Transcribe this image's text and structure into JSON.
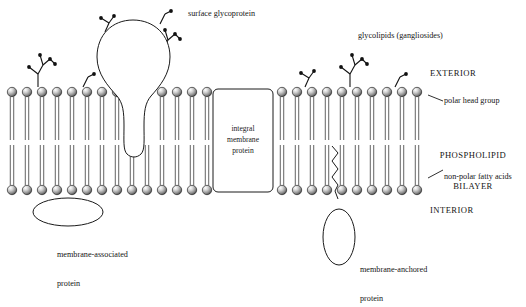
{
  "figure": {
    "type": "biology-diagram",
    "width": 526,
    "height": 277,
    "background": "#ffffff",
    "stroke": "#1a1a1a"
  },
  "labels": {
    "surface_glycoprotein": "surface glycoprotein",
    "glycolipids": "glycolipids (gangliosides)",
    "exterior": "EXTERIOR",
    "polar_head_group": "polar head group",
    "phospholipid_bilayer_line1": "PHOSPHOLIPID",
    "phospholipid_bilayer_line2": "BILAYER",
    "non_polar_fatty_acids": "non-polar fatty acids",
    "interior": "INTERIOR",
    "integral_membrane_protein_line1": "integral",
    "integral_membrane_protein_line2": "membrane",
    "integral_membrane_protein_line3": "protein",
    "membrane_associated_line1": "membrane-associated",
    "membrane_associated_line2": "protein",
    "membrane_anchored_line1": "membrane-anchored",
    "membrane_anchored_line2": "protein"
  },
  "membrane": {
    "outer_head_y": 92,
    "inner_head_y": 190,
    "head_radius": 4.7,
    "lipid_spacing": 15,
    "outer_tail_bottom": 140,
    "inner_tail_top": 145,
    "left_edge": 8,
    "right_edge": 425,
    "head_fill_light": "#f2f2f2",
    "head_fill_dark": "#4a4a4a",
    "tail_color": "#6b6b6b"
  },
  "structures": {
    "integral_protein_box": {
      "x": 213,
      "y": 89,
      "w": 60,
      "h": 103,
      "radius": 5
    },
    "surface_glycoprotein_bulb": {
      "cx": 133,
      "cy": 58,
      "rx": 36,
      "ry": 38
    },
    "membrane_associated_ellipse": {
      "cx": 68,
      "cy": 212,
      "rx": 35,
      "ry": 14
    },
    "membrane_anchored_ellipse": {
      "cx": 339,
      "cy": 237,
      "rx": 16,
      "ry": 28
    }
  },
  "colors": {
    "line": "#1a1a1a",
    "text": "#151515",
    "protein_fill": "#ffffff"
  }
}
